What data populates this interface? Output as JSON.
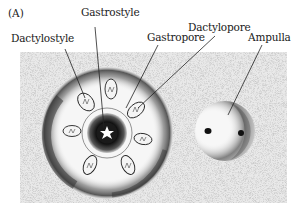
{
  "figure": {
    "panel_label": "(A)",
    "labels": {
      "gastrostyle": "Gastrostyle",
      "dactylostyle": "Dactylostyle",
      "gastropore": "Gastropore",
      "dactylopore": "Dactylopore",
      "ampulla": "Ampulla"
    }
  }
}
